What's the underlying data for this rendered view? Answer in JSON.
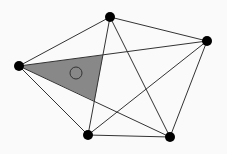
{
  "diagram": {
    "type": "complete-graph-K5",
    "colors": {
      "background": "#fafafa",
      "edge": "#333333",
      "node": "#000000",
      "shaded_region": "#888888",
      "marker_circle": "#333333"
    },
    "nodes": [
      {
        "id": "left",
        "x": 19,
        "y": 66
      },
      {
        "id": "top",
        "x": 110,
        "y": 17
      },
      {
        "id": "right",
        "x": 207,
        "y": 41
      },
      {
        "id": "bottom-left",
        "x": 88,
        "y": 135
      },
      {
        "id": "bottom-right",
        "x": 170,
        "y": 137
      }
    ],
    "edges": [
      [
        "left",
        "top"
      ],
      [
        "left",
        "right"
      ],
      [
        "left",
        "bottom-left"
      ],
      [
        "left",
        "bottom-right"
      ],
      [
        "top",
        "right"
      ],
      [
        "top",
        "bottom-left"
      ],
      [
        "top",
        "bottom-right"
      ],
      [
        "right",
        "bottom-left"
      ],
      [
        "right",
        "bottom-right"
      ],
      [
        "bottom-left",
        "bottom-right"
      ]
    ],
    "shaded_region": {
      "points": [
        [
          19,
          66
        ],
        [
          103,
          55
        ],
        [
          94.5,
          101
        ]
      ]
    },
    "marker_circle": {
      "cx": 76,
      "cy": 73,
      "r": 6
    }
  }
}
